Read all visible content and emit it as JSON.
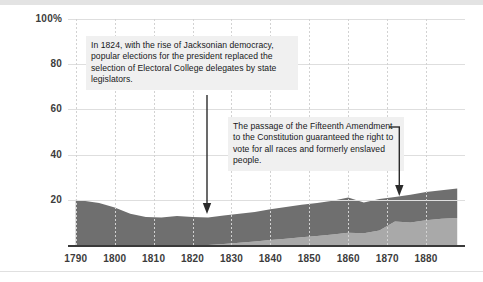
{
  "chart_data": {
    "type": "area",
    "title": "",
    "subtitle": "",
    "xlabel": "",
    "ylabel": "",
    "stacked": true,
    "grid": true,
    "legend_position": "none",
    "xlim": [
      1788,
      1890
    ],
    "ylim": [
      0,
      100
    ],
    "yticks": [
      "100%",
      "80",
      "60",
      "40",
      "20"
    ],
    "ytick_values": [
      100,
      80,
      60,
      40,
      20
    ],
    "xticks": [
      "1790",
      "1800",
      "1810",
      "1820",
      "1830",
      "1840",
      "1850",
      "1860",
      "1870",
      "1880"
    ],
    "xtick_values": [
      1790,
      1800,
      1810,
      1820,
      1830,
      1840,
      1850,
      1860,
      1870,
      1880
    ],
    "x": [
      1790,
      1792,
      1796,
      1800,
      1804,
      1808,
      1812,
      1816,
      1820,
      1824,
      1828,
      1832,
      1836,
      1840,
      1844,
      1848,
      1852,
      1856,
      1860,
      1864,
      1868,
      1872,
      1876,
      1880,
      1884,
      1888
    ],
    "series": [
      {
        "name": "lower-band",
        "color": "#a9a9a9",
        "values": [
          0,
          0,
          0,
          0,
          0,
          0,
          0,
          0,
          0,
          0,
          0.4,
          1.0,
          1.6,
          2.2,
          2.8,
          3.4,
          4.0,
          4.6,
          5.4,
          5.2,
          6.4,
          10.4,
          10.0,
          11.0,
          11.6,
          12.0
        ]
      },
      {
        "name": "upper-band",
        "color": "#6f6f6f",
        "values": [
          20.0,
          19.6,
          18.6,
          16.6,
          13.8,
          12.4,
          12.2,
          12.8,
          12.4,
          12.2,
          12.6,
          12.8,
          13.0,
          13.6,
          14.0,
          14.4,
          14.6,
          15.0,
          15.6,
          13.6,
          14.0,
          10.8,
          12.2,
          12.4,
          12.6,
          13.0
        ]
      }
    ],
    "annotations": [
      {
        "id": "annotation-1824",
        "text": "In 1824, with the rise of Jacksonian democracy, popular elections for the president replaced the selection of Electoral College delegates by state legislators.",
        "arrow": "down",
        "arrow_x_value": 1824
      },
      {
        "id": "annotation-fifteenth-amendment",
        "text": "The passage of the Fifteenth Amendment to the Constitution guaranteed the right to vote for all races and formerly enslaved people.",
        "arrow": "bracket-down",
        "arrow_x_value": 1870
      }
    ],
    "colors": {
      "upper_band": "#6f6f6f",
      "lower_band": "#a9a9a9",
      "axis": "#3a3a3a",
      "grid": "#dedede",
      "vgrid": "#d2d2d2",
      "annotation_background": "#f0f0f0",
      "text": "#17181a"
    }
  },
  "left_crop_glyph": "·"
}
